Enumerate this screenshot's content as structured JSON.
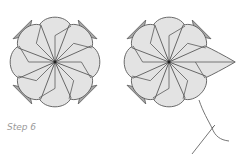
{
  "caption": {
    "step_label": "Step 6"
  },
  "diagram": {
    "figures": [
      {
        "name": "flower-before",
        "description": "octagonal folded origami flower, 8 petals"
      },
      {
        "name": "flower-after",
        "description": "same flower with one petal pulled out to a point, with thread"
      }
    ],
    "colors": {
      "paper": "#e3e3e3",
      "shadow": "#a9a9a9",
      "line": "#5a5a5a",
      "caption": "#9a9a9a"
    }
  }
}
